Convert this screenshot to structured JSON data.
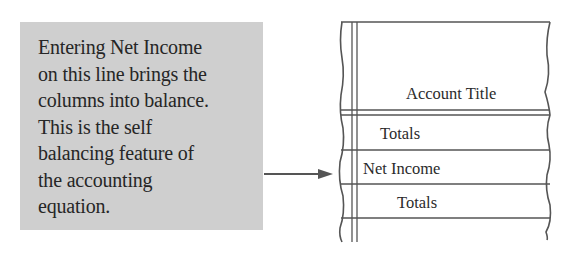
{
  "callout": {
    "text": "Entering Net Income\non this line brings the\ncolumns into balance.\nThis is the self\nbalancing feature of\nthe accounting\nequation.",
    "background": "#cfcfcf"
  },
  "ledger": {
    "header": "Account Title",
    "rows": [
      {
        "label": "Totals"
      },
      {
        "label": "Net Income"
      },
      {
        "label": "Totals"
      }
    ],
    "line_color": "#555555"
  },
  "arrow": {
    "color": "#555555",
    "points_to": "Net Income"
  }
}
